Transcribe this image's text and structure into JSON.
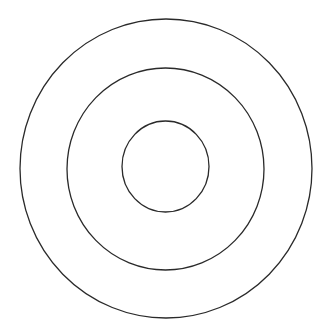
{
  "diagram": {
    "type": "concentric-circles",
    "background": "#ffffff",
    "stroke_color": "#2a2a2a",
    "stroke_width": 1.3,
    "circles": [
      {
        "name": "outer",
        "cx": 166,
        "cy": 168.5,
        "rx": 146,
        "ry": 149.5
      },
      {
        "name": "middle",
        "cx": 165.5,
        "cy": 169,
        "rx": 98.5,
        "ry": 101
      },
      {
        "name": "inner",
        "cx": 165.5,
        "cy": 166.5,
        "rx": 43.5,
        "ry": 45.5
      }
    ]
  }
}
